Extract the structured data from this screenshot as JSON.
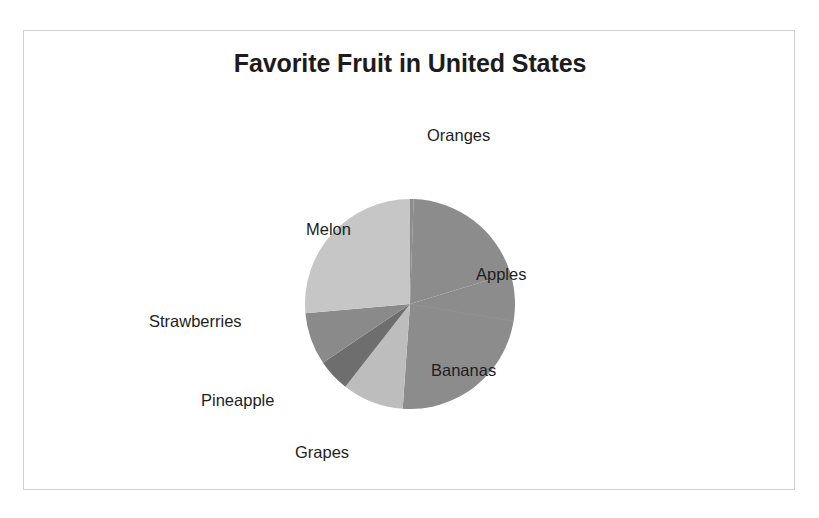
{
  "chart_data": {
    "type": "pie",
    "title": "Favorite Fruit in United States",
    "xlabel": "",
    "ylabel": "",
    "legend": "none",
    "grid": false,
    "labels_position": "outside-and-inside",
    "start_angle_deg": 0,
    "direction": "clockwise",
    "categories": [
      "Oranges",
      "Apples",
      "Bananas",
      "Grapes",
      "Pineapple",
      "Strawberries",
      "Melon"
    ],
    "values": [
      0.6,
      19.7,
      30.8,
      9.4,
      5.0,
      8.1,
      26.4
    ],
    "value_unit": "percent",
    "slices": [
      {
        "label": "Oranges",
        "value": 0.6,
        "start_deg": 0,
        "end_deg": 2,
        "color": "#8c8c8c"
      },
      {
        "label": "Apples",
        "value": 19.7,
        "start_deg": 2,
        "end_deg": 73,
        "color": "#8c8c8c"
      },
      {
        "label": "Bananas",
        "value": 30.8,
        "start_deg": 73,
        "end_deg": 184,
        "color": "#8c8c8c"
      },
      {
        "label": "Grapes",
        "value": 9.4,
        "start_deg": 184,
        "end_deg": 218,
        "color": "#bdbdbd"
      },
      {
        "label": "Pineapple",
        "value": 5.0,
        "start_deg": 218,
        "end_deg": 236,
        "color": "#6e6e6e"
      },
      {
        "label": "Strawberries",
        "value": 8.1,
        "start_deg": 236,
        "end_deg": 265,
        "color": "#8a8a8a"
      },
      {
        "label": "Melon",
        "value": 26.4,
        "start_deg": 265,
        "end_deg": 360,
        "color": "#c6c6c6"
      }
    ],
    "geometry": {
      "center_x": 386,
      "center_y": 273,
      "radius": 105
    },
    "colors": {
      "oranges": "#8c8c8c",
      "apples": "#8c8c8c",
      "bananas": "#8c8c8c",
      "grapes": "#bdbdbd",
      "pineapple": "#6e6e6e",
      "strawberries": "#8a8a8a",
      "melon": "#c6c6c6",
      "title_text": "#1c1c1c",
      "label_text": "#1e1e1e",
      "frame_border": "#d2d2d2",
      "background": "#ffffff"
    }
  },
  "labels": {
    "oranges": "Oranges",
    "apples": "Apples",
    "bananas": "Bananas",
    "grapes": "Grapes",
    "pineapple": "Pineapple",
    "strawberries": "Strawberries",
    "melon": "Melon"
  }
}
